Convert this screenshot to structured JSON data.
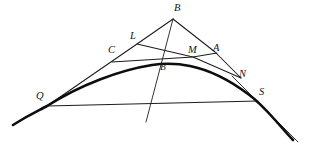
{
  "figure": {
    "background_color": "#ffffff",
    "ink_color": "#1c1c1c",
    "curve_color": "#0d0d0d",
    "width": 310,
    "height": 151,
    "labels": [
      {
        "id": "B",
        "text": "B",
        "x": 174,
        "y": 3,
        "size": "normal"
      },
      {
        "id": "L",
        "text": "L",
        "x": 130,
        "y": 31,
        "size": "normal"
      },
      {
        "id": "C",
        "text": "C",
        "x": 108,
        "y": 45,
        "size": "normal"
      },
      {
        "id": "M",
        "text": "M",
        "x": 188,
        "y": 45,
        "size": "normal"
      },
      {
        "id": "A",
        "text": "A",
        "x": 213,
        "y": 43,
        "size": "normal"
      },
      {
        "id": "B2",
        "text": "B\"",
        "x": 160,
        "y": 63,
        "size": "small"
      },
      {
        "id": "N",
        "text": "N",
        "x": 239,
        "y": 69,
        "size": "normal"
      },
      {
        "id": "S",
        "text": "S",
        "x": 259,
        "y": 87,
        "size": "normal"
      },
      {
        "id": "Q",
        "text": "Q",
        "x": 36,
        "y": 91,
        "size": "normal"
      }
    ],
    "points": {
      "B": {
        "x": 173,
        "y": 19
      },
      "L": {
        "x": 137,
        "y": 44
      },
      "C": {
        "x": 113,
        "y": 60
      },
      "M": {
        "x": 193,
        "y": 57
      },
      "A": {
        "x": 215,
        "y": 52
      },
      "Bpp": {
        "x": 168,
        "y": 64
      },
      "N": {
        "x": 241,
        "y": 78
      },
      "S": {
        "x": 258,
        "y": 101
      },
      "Q": {
        "x": 47,
        "y": 106
      }
    },
    "segments": [
      {
        "name": "line-B-to-Q",
        "from": "B",
        "to": "Q"
      },
      {
        "name": "line-B-to-N",
        "from": "B",
        "to": "N"
      },
      {
        "name": "line-B-steep-lower",
        "from": "B",
        "to": "lower-left-end"
      },
      {
        "name": "line-L-to-N",
        "from": "L",
        "to": "N"
      },
      {
        "name": "line-C-to-A",
        "from": "C",
        "to": "A"
      },
      {
        "name": "chord-Q-to-S",
        "from": "Q",
        "to": "S"
      }
    ],
    "curve": {
      "name": "parabola-arc",
      "through": [
        "Q",
        "Bpp",
        "N",
        "S"
      ],
      "apex": {
        "x": 170,
        "y": 64
      },
      "left_tail_end": {
        "x": 13,
        "y": 125
      },
      "right_tail_end": {
        "x": 293,
        "y": 140
      }
    },
    "aux_line": {
      "name": "tangent-tail-right",
      "from": {
        "x": 258,
        "y": 101
      },
      "to": {
        "x": 298,
        "y": 142
      }
    }
  }
}
